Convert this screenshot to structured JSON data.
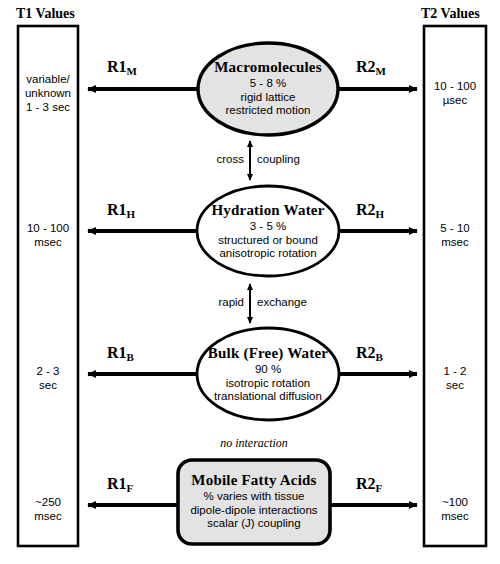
{
  "columns": {
    "left": {
      "header": "T1 Values",
      "values": [
        {
          "lines": [
            "variable/",
            "unknown",
            "1 - 3 sec"
          ]
        },
        {
          "lines": [
            "10 - 100",
            "msec"
          ]
        },
        {
          "lines": [
            "2 - 3",
            "sec"
          ]
        },
        {
          "lines": [
            "~250",
            "msec"
          ]
        }
      ]
    },
    "right": {
      "header": "T2 Values",
      "values": [
        {
          "lines": [
            "10 - 100",
            "µsec"
          ]
        },
        {
          "lines": [
            "5 - 10",
            "msec"
          ]
        },
        {
          "lines": [
            "1 - 2",
            "sec"
          ]
        },
        {
          "lines": [
            "~100",
            "msec"
          ]
        }
      ]
    }
  },
  "nodes": [
    {
      "title": "Macromolecules",
      "lines": [
        "5 - 8 %",
        "rigid lattice",
        "restricted motion"
      ],
      "shape": "ellipse",
      "fill": "#e3e3e3"
    },
    {
      "title": "Hydration Water",
      "lines": [
        "3 - 5 %",
        "structured or bound",
        "anisotropic rotation"
      ],
      "shape": "ellipse",
      "fill": "#ffffff"
    },
    {
      "title": "Bulk (Free) Water",
      "lines": [
        "90 %",
        "isotropic rotation",
        "translational diffusion"
      ],
      "shape": "ellipse",
      "fill": "#ffffff"
    },
    {
      "title": "Mobile Fatty Acids",
      "lines": [
        "% varies with tissue",
        "dipole-dipole interactions",
        "scalar (J) coupling"
      ],
      "shape": "rounded-rect",
      "fill": "#e3e3e3"
    }
  ],
  "rates": {
    "left": [
      {
        "base": "R1",
        "sub": "M"
      },
      {
        "base": "R1",
        "sub": "H"
      },
      {
        "base": "R1",
        "sub": "B"
      },
      {
        "base": "R1",
        "sub": "F"
      }
    ],
    "right": [
      {
        "base": "R2",
        "sub": "M"
      },
      {
        "base": "R2",
        "sub": "H"
      },
      {
        "base": "R2",
        "sub": "B"
      },
      {
        "base": "R2",
        "sub": "F"
      }
    ]
  },
  "links": [
    {
      "left_word": "cross",
      "right_word": "coupling",
      "arrow": "double"
    },
    {
      "left_word": "rapid",
      "right_word": "exchange",
      "arrow": "double"
    },
    {
      "text": "no interaction",
      "arrow": "none",
      "style": "italic"
    }
  ],
  "colors": {
    "stroke": "#000000",
    "background": "#ffffff",
    "node_gray": "#e3e3e3"
  }
}
